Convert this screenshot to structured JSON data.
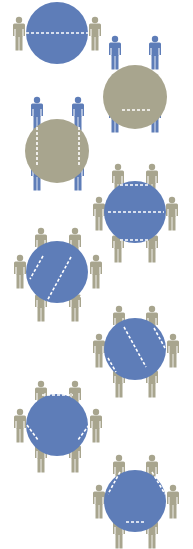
{
  "colors": {
    "background": "#ffffff",
    "blue": "#5e7db8",
    "khaki": "#a8a58e",
    "dash": "#ffffff"
  },
  "tables": [
    {
      "id": "two-seat-split",
      "cx": 57,
      "cy": 33,
      "r": 31,
      "fill": "blue",
      "people_color": "khaki",
      "people": [
        [
          19,
          33
        ],
        [
          95,
          33
        ]
      ],
      "dashes": [
        [
          26,
          33,
          88,
          33
        ]
      ]
    },
    {
      "id": "four-seat-horizontal-split",
      "cx": 135,
      "cy": 97,
      "r": 32,
      "fill": "khaki",
      "people_color": "blue",
      "people": [
        [
          115,
          52
        ],
        [
          155,
          52
        ],
        [
          115,
          115
        ],
        [
          155,
          115
        ]
      ],
      "dashes": [
        [
          120,
          60,
          150,
          60
        ],
        [
          122,
          110,
          150,
          110
        ]
      ]
    },
    {
      "id": "four-seat-vertical-split",
      "cx": 57,
      "cy": 151,
      "r": 32,
      "fill": "khaki",
      "people_color": "blue",
      "people": [
        [
          37,
          113
        ],
        [
          78,
          113
        ],
        [
          37,
          173
        ],
        [
          78,
          173
        ]
      ],
      "dashes": [
        [
          37,
          127,
          37,
          165
        ],
        [
          79,
          127,
          79,
          165
        ]
      ]
    },
    {
      "id": "six-seat-horizontal-bands",
      "cx": 135,
      "cy": 212,
      "r": 31,
      "fill": "blue",
      "people_color": "khaki",
      "people": [
        [
          118,
          180
        ],
        [
          152,
          180
        ],
        [
          99,
          213
        ],
        [
          172,
          213
        ],
        [
          118,
          245
        ],
        [
          152,
          245
        ]
      ],
      "dashes": [
        [
          120,
          185,
          150,
          185
        ],
        [
          108,
          212,
          164,
          212
        ],
        [
          120,
          240,
          148,
          240
        ]
      ]
    },
    {
      "id": "six-seat-diagonal-bands",
      "cx": 57,
      "cy": 272,
      "r": 31,
      "fill": "blue",
      "people_color": "khaki",
      "people": [
        [
          41,
          244
        ],
        [
          75,
          244
        ],
        [
          20,
          271
        ],
        [
          96,
          271
        ],
        [
          41,
          304
        ],
        [
          75,
          304
        ]
      ],
      "dashes": [
        [
          43,
          256,
          30,
          279
        ],
        [
          71,
          257,
          47,
          301
        ],
        [
          87,
          286,
          80,
          298
        ]
      ]
    },
    {
      "id": "six-seat-diagonal-bands-reverse",
      "cx": 135,
      "cy": 349,
      "r": 31,
      "fill": "blue",
      "people_color": "khaki",
      "people": [
        [
          119,
          322
        ],
        [
          152,
          322
        ],
        [
          99,
          350
        ],
        [
          173,
          350
        ],
        [
          119,
          380
        ],
        [
          152,
          380
        ]
      ],
      "dashes": [
        [
          124,
          327,
          146,
          367
        ],
        [
          154,
          328,
          165,
          348
        ],
        [
          108,
          358,
          116,
          372
        ]
      ]
    },
    {
      "id": "six-seat-triangle-bottom",
      "cx": 57,
      "cy": 425,
      "r": 31,
      "fill": "blue",
      "people_color": "khaki",
      "people": [
        [
          41,
          397
        ],
        [
          75,
          397
        ],
        [
          20,
          425
        ],
        [
          96,
          425
        ],
        [
          41,
          455
        ],
        [
          75,
          455
        ]
      ],
      "dashes": [
        [
          42,
          395,
          73,
          395
        ],
        [
          27,
          425,
          38,
          440
        ],
        [
          89,
          425,
          78,
          440
        ]
      ]
    },
    {
      "id": "six-seat-triangle-top",
      "cx": 135,
      "cy": 501,
      "r": 31,
      "fill": "blue",
      "people_color": "khaki",
      "people": [
        [
          119,
          471
        ],
        [
          152,
          471
        ],
        [
          99,
          501
        ],
        [
          173,
          501
        ],
        [
          119,
          531
        ],
        [
          152,
          531
        ]
      ],
      "dashes": [
        [
          120,
          472,
          108,
          494
        ],
        [
          152,
          472,
          165,
          494
        ],
        [
          126,
          522,
          146,
          522
        ]
      ]
    }
  ]
}
